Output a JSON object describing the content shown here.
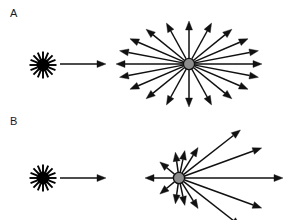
{
  "figure": {
    "width": 289,
    "height": 220,
    "background_color": "#ffffff",
    "stroke_color": "#111111",
    "node_fill_color": "#8c8c8c",
    "node_stroke_color": "#111111",
    "source_color": "#000000"
  },
  "panels": [
    {
      "id": "A",
      "label": "A",
      "label_position": {
        "x": 10,
        "y": 8
      },
      "scattering_type": "isotropic",
      "source": {
        "name": "light-source-starburst",
        "center": {
          "x": 43,
          "y": 65
        },
        "ray_count": 16,
        "core_radius": 6.5,
        "ray_inner_radius": 6.0,
        "ray_outer_radius": 13.5,
        "ray_width": 1.9,
        "color": "#000000"
      },
      "incident_beam": {
        "name": "incident-beam-arrow",
        "from": {
          "x": 60,
          "y": 64
        },
        "to": {
          "x": 106,
          "y": 64
        },
        "stroke_width": 1.7,
        "head_length": 9,
        "head_width": 7
      },
      "scatter_center": {
        "name": "scattering-particle",
        "center": {
          "x": 189,
          "y": 64
        },
        "radius": 5.6,
        "fill": "#8c8c8c",
        "stroke": "#111111",
        "stroke_width": 1.4
      },
      "scatter_pattern": {
        "name": "isotropic-scatter-arrows",
        "arrow_count": 20,
        "radius_x": 73,
        "radius_y": 43,
        "inner_gap": 6,
        "stroke_width": 1.5,
        "head_length": 9,
        "head_width": 7,
        "angles_deg": [
          0,
          18,
          36,
          54,
          72,
          90,
          108,
          126,
          144,
          162,
          180,
          198,
          216,
          234,
          252,
          270,
          288,
          306,
          324,
          342
        ]
      }
    },
    {
      "id": "B",
      "label": "B",
      "label_position": {
        "x": 10,
        "y": 116
      },
      "scattering_type": "forward-peaked anisotropic",
      "source": {
        "name": "light-source-starburst",
        "center": {
          "x": 43,
          "y": 178
        },
        "ray_count": 16,
        "core_radius": 6.5,
        "ray_inner_radius": 6.0,
        "ray_outer_radius": 13.5,
        "ray_width": 1.9,
        "color": "#000000"
      },
      "incident_beam": {
        "name": "incident-beam-arrow",
        "from": {
          "x": 60,
          "y": 178
        },
        "to": {
          "x": 106,
          "y": 178
        },
        "stroke_width": 1.7,
        "head_length": 9,
        "head_width": 7
      },
      "scatter_center": {
        "name": "scattering-particle",
        "center": {
          "x": 179,
          "y": 178
        },
        "radius": 5.6,
        "fill": "#8c8c8c",
        "stroke": "#111111",
        "stroke_width": 1.4
      },
      "scatter_pattern": {
        "name": "anisotropic-scatter-arrows",
        "inner_gap": 6,
        "stroke_width": 1.5,
        "head_length": 9,
        "head_width": 7,
        "arrows": [
          {
            "angle_deg": 0,
            "length": 104,
            "note": "forward, longest"
          },
          {
            "angle_deg": 20,
            "length": 88,
            "note": "forward upper"
          },
          {
            "angle_deg": 38,
            "length": 78,
            "note": "forward upper-oblique"
          },
          {
            "angle_deg": 58,
            "length": 36,
            "note": "side upper"
          },
          {
            "angle_deg": 78,
            "length": 28,
            "note": "near-transverse upper"
          },
          {
            "angle_deg": 98,
            "length": 26,
            "note": "near-transverse upper"
          },
          {
            "angle_deg": 140,
            "length": 25,
            "note": "back upper"
          },
          {
            "angle_deg": 180,
            "length": 34,
            "note": "backscatter"
          },
          {
            "angle_deg": 220,
            "length": 25,
            "note": "back lower"
          },
          {
            "angle_deg": 262,
            "length": 26,
            "note": "near-transverse lower"
          },
          {
            "angle_deg": 282,
            "length": 28,
            "note": "near-transverse lower"
          },
          {
            "angle_deg": 302,
            "length": 36,
            "note": "side lower"
          },
          {
            "angle_deg": 322,
            "length": 78,
            "note": "forward lower-oblique"
          },
          {
            "angle_deg": 340,
            "length": 88,
            "note": "forward lower"
          }
        ]
      }
    }
  ]
}
